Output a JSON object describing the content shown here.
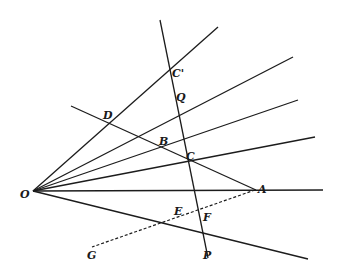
{
  "diagram": {
    "type": "geometric-construction",
    "origin": {
      "name": "O",
      "x": 33,
      "y": 191
    },
    "rays_from_O": [
      {
        "end": [
          218,
          27
        ]
      },
      {
        "end": [
          293,
          57
        ]
      },
      {
        "end": [
          298,
          100
        ]
      },
      {
        "end": [
          315,
          137
        ]
      },
      {
        "end": [
          323,
          190
        ]
      },
      {
        "end": [
          308,
          259
        ]
      }
    ],
    "transversal": {
      "from": [
        160,
        20
      ],
      "to": [
        208,
        258
      ]
    },
    "line_DA": {
      "from": [
        71,
        106
      ],
      "to": [
        256,
        190
      ]
    },
    "dashed_line_AG": {
      "from": [
        255,
        190
      ],
      "to": [
        92,
        247
      ]
    },
    "labels": [
      {
        "id": "C_prime",
        "text": "C'",
        "x": 172,
        "y": 77
      },
      {
        "id": "Q",
        "text": "Q",
        "x": 176,
        "y": 101
      },
      {
        "id": "D",
        "text": "D",
        "x": 103,
        "y": 119
      },
      {
        "id": "B",
        "text": "B",
        "x": 159,
        "y": 145
      },
      {
        "id": "C",
        "text": "C",
        "x": 186,
        "y": 160
      },
      {
        "id": "O",
        "text": "O",
        "x": 20,
        "y": 198
      },
      {
        "id": "A",
        "text": "A",
        "x": 258,
        "y": 193
      },
      {
        "id": "E",
        "text": "E",
        "x": 174,
        "y": 215
      },
      {
        "id": "F",
        "text": "F",
        "x": 203,
        "y": 221
      },
      {
        "id": "G",
        "text": "G",
        "x": 87,
        "y": 259
      },
      {
        "id": "P",
        "text": "P",
        "x": 203,
        "y": 259
      }
    ]
  }
}
